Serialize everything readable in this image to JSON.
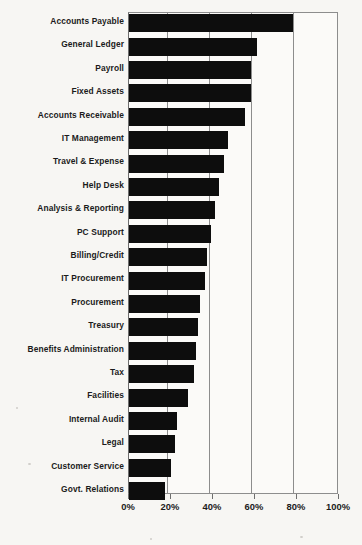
{
  "chart_data": {
    "type": "bar",
    "orientation": "horizontal",
    "title": "",
    "xlabel": "",
    "ylabel": "",
    "xlim": [
      0,
      100
    ],
    "xticks": [
      "0%",
      "20%",
      "40%",
      "60%",
      "80%",
      "100%"
    ],
    "xtick_values": [
      0,
      20,
      40,
      60,
      80,
      100
    ],
    "grid": true,
    "legend": "none",
    "bar_color": "#0d0d0d",
    "categories": [
      "Accounts Payable",
      "General Ledger",
      "Payroll",
      "Fixed Assets",
      "Accounts Receivable",
      "IT Management",
      "Travel & Expense",
      "Help Desk",
      "Analysis & Reporting",
      "PC Support",
      "Billing/Credit",
      "IT Procurement",
      "Procurement",
      "Treasury",
      "Benefits Administration",
      "Tax",
      "Facilities",
      "Internal Audit",
      "Legal",
      "Customer Service",
      "Govt. Relations"
    ],
    "values": [
      78,
      61,
      58,
      58,
      55,
      47,
      45,
      43,
      41,
      39,
      37,
      36,
      34,
      33,
      32,
      31,
      28,
      23,
      22,
      20,
      17
    ]
  }
}
